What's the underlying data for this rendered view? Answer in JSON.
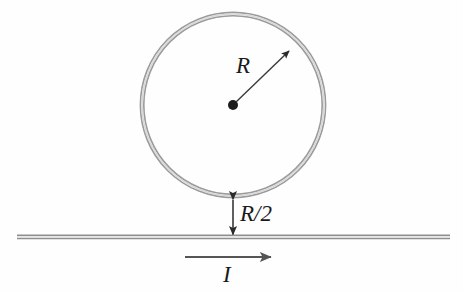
{
  "figure": {
    "background_color": "#fefefe",
    "stroke_color": "#8a8a8a",
    "dark_stroke_color": "#3a3a3a",
    "text_color": "#1a1a1a"
  },
  "labels": {
    "radius": "R",
    "separation": "R/2",
    "current": "I"
  },
  "geometry": {
    "loop": {
      "center_x": 233,
      "center_y": 105,
      "radius": 91,
      "stroke_width": 2,
      "style": "double-line ring"
    },
    "center_dot": {
      "x": 233,
      "y": 105,
      "radius": 5
    },
    "radius_arrow": {
      "from_x": 233,
      "from_y": 105,
      "to_x": 290,
      "to_y": 50
    },
    "gap_arrow": {
      "x": 233,
      "top_y": 199,
      "bottom_y": 236,
      "double_headed": true
    },
    "wire": {
      "start_x": 17,
      "end_x": 450,
      "y": 237,
      "style": "double-line"
    },
    "current_arrow": {
      "from_x": 185,
      "from_y": 257,
      "to_x": 272,
      "to_y": 257,
      "direction": "right"
    }
  }
}
